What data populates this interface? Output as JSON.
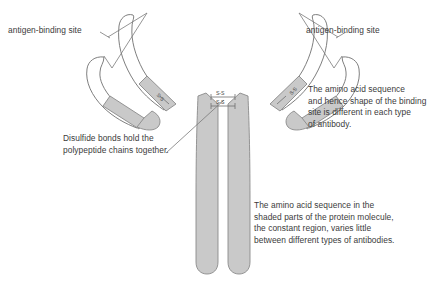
{
  "figure": {
    "colors": {
      "shaded_region": "#c9c9c9",
      "shaded_stroke": "#8a8a8a",
      "unshaded_region": "#ffffff",
      "unshaded_stroke": "#6f6f6f",
      "text": "#3b3b3b",
      "leader_line": "#7a7a7a",
      "background": "#ffffff"
    }
  },
  "annotations": {
    "antigen_binding_left": "antigen-binding site",
    "antigen_binding_right": "antigen-binding site",
    "disulfide": "Disulfide bonds hold the\npolypeptide chains together.",
    "variable_region": "The amino acid sequence\nand hence shape of the binding\nsite is different in each type\nof antibody.",
    "constant_region": "The amino acid sequence in the\nshaded parts of the protein molecule,\nthe constant region, varies little\nbetween different types of antibodies."
  },
  "bond_labels": {
    "hinge_upper": "S-S",
    "hinge_lower": "S-S",
    "left_arm": "S-S",
    "right_arm": "S-S"
  }
}
